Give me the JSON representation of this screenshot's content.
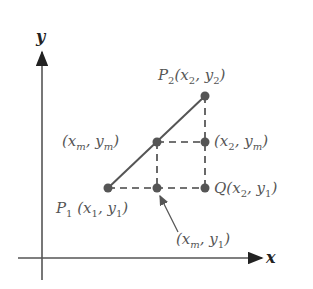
{
  "diagram": {
    "axes": {
      "x_label": "x",
      "y_label": "y"
    },
    "points": {
      "p2": {
        "name": "P",
        "sub": "2",
        "coords": "(x",
        "xsub": "2",
        "sep": ", y",
        "ysub": "2",
        "close": ")"
      },
      "xm_ym": {
        "open": "(x",
        "xsub": "m",
        "sep": ", y",
        "ysub": "m",
        "close": ")"
      },
      "x2_ym": {
        "open": "(x",
        "xsub": "2",
        "sep": ", y",
        "ysub": "m",
        "close": ")"
      },
      "p1": {
        "name": "P",
        "sub": "1",
        "coords": " (x",
        "xsub": "1",
        "sep": ", y",
        "ysub": "1",
        "close": ")"
      },
      "q": {
        "name": "Q",
        "coords": "(x",
        "xsub": "2",
        "sep": ", y",
        "ysub": "1",
        "close": ")"
      },
      "xm_y1": {
        "open": "(x",
        "xsub": "m",
        "sep": ", y",
        "ysub": "1",
        "close": ")"
      }
    },
    "colors": {
      "point": "#555555",
      "line": "#555555",
      "axis": "#444444"
    }
  }
}
